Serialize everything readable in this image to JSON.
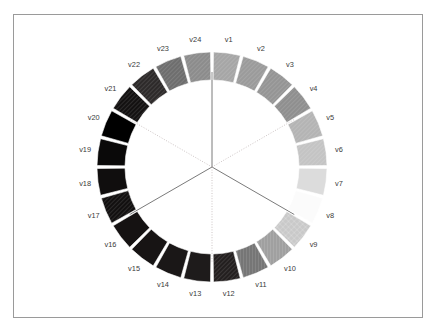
{
  "figure": {
    "type": "circular-segment-ring",
    "background_color": "#ffffff",
    "frame_border_color": "#9a9a9a",
    "label_color": "#3a3a3a",
    "segment_gap_color": "#ffffff"
  },
  "chart_data": {
    "type": "pie",
    "title": "",
    "subtitle": "",
    "xlabel": "",
    "ylabel": "",
    "legend_position": "none",
    "grid": false,
    "shape": "donut",
    "segment_count": 24,
    "equal_angles": true,
    "angle_per_segment_deg": 15,
    "start_angle_deg": -90,
    "center": {
      "x": 212,
      "y": 167
    },
    "outer_radius": 115,
    "inner_radius": 87,
    "categories": [
      "v1",
      "v2",
      "v3",
      "v4",
      "v5",
      "v6",
      "v7",
      "v8",
      "v9",
      "v10",
      "v11",
      "v12",
      "v13",
      "v14",
      "v15",
      "v16",
      "v17",
      "v18",
      "v19",
      "v20",
      "v21",
      "v22",
      "v23",
      "v24"
    ],
    "values": [
      1,
      1,
      1,
      1,
      1,
      1,
      1,
      1,
      1,
      1,
      1,
      1,
      1,
      1,
      1,
      1,
      1,
      1,
      1,
      1,
      1,
      1,
      1,
      1
    ],
    "colors": [
      "#a6a6a6",
      "#9b9b9b",
      "#959595",
      "#8f8f8f",
      "#b4b4b4",
      "#c4c4c4",
      "#dcdcdc",
      "#fbfbfb",
      "#c9c9c9",
      "#a0a0a0",
      "#767676",
      "#231f1f",
      "#1e1b1b",
      "#1a1717",
      "#171414",
      "#151212",
      "#121010",
      "#100e0e",
      "#0a0909",
      "#000000",
      "#131111",
      "#2d2a2a",
      "#6e6e6e",
      "#8c8c8c"
    ],
    "hatch_patterns": [
      "diagonal",
      "diagonal",
      "diagonal",
      "diagonal",
      "diagonal",
      "diagonal",
      "none",
      "none",
      "crosshatch",
      "vertical",
      "vertical",
      "diagonal",
      "none",
      "none",
      "none",
      "none",
      "diagonal",
      "none",
      "none",
      "none",
      "diagonal",
      "diagonal",
      "diagonal",
      "diagonal"
    ],
    "labels": [
      "v1",
      "v2",
      "v3",
      "v4",
      "v5",
      "v6",
      "v7",
      "v8",
      "v9",
      "v10",
      "v11",
      "v12",
      "v13",
      "v14",
      "v15",
      "v16",
      "v17",
      "v18",
      "v19",
      "v20",
      "v21",
      "v22",
      "v23",
      "v24"
    ]
  },
  "spokes": {
    "count": 6,
    "radius": 95,
    "items": [
      {
        "name": "spoke-up",
        "angle_deg": -90,
        "style": "solid",
        "color": "#6b6b6b"
      },
      {
        "name": "spoke-upper-right",
        "angle_deg": -30,
        "style": "dotted",
        "color": "#c0b6b6"
      },
      {
        "name": "spoke-lower-right",
        "angle_deg": 30,
        "style": "solid",
        "color": "#6b6b6b"
      },
      {
        "name": "spoke-down",
        "angle_deg": 90,
        "style": "dotted",
        "color": "#c0b6b6"
      },
      {
        "name": "spoke-lower-left",
        "angle_deg": 150,
        "style": "solid",
        "color": "#6b6b6b"
      },
      {
        "name": "spoke-upper-left",
        "angle_deg": -150,
        "style": "dotted",
        "color": "#c0b6b6"
      }
    ]
  },
  "label_layout": {
    "radius": 128,
    "font_size_px": 7.4
  }
}
